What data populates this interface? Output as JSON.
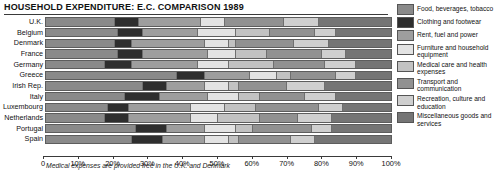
{
  "title": "HOUSEHOLD EXPENDITURE: E.C. COMPARISON  1989",
  "footnote": "Medical expenses are provided free in the U.K. and Denmark",
  "axis": {
    "ticks": [
      "0",
      "10%",
      "20%",
      "30%",
      "40%",
      "50%",
      "60%",
      "70%",
      "80%",
      "90%",
      "100%"
    ],
    "tick_values": [
      0,
      10,
      20,
      30,
      40,
      50,
      60,
      70,
      80,
      90,
      100
    ]
  },
  "chart_data": {
    "type": "bar",
    "orientation": "horizontal",
    "stacked": true,
    "stack_total": 100,
    "title": "HOUSEHOLD EXPENDITURE: E.C. COMPARISON  1989",
    "xlabel": "",
    "ylabel": "",
    "xlim": [
      0,
      100
    ],
    "grid": false,
    "legend_position": "right",
    "note": "Medical expenses are provided free in the U.K. and Denmark",
    "categories": [
      "U.K.",
      "Belgium",
      "Denmark",
      "France",
      "Germany",
      "Greece",
      "Irish Rep.",
      "Italy",
      "Luxembourg",
      "Netherlands",
      "Portugal",
      "Spain"
    ],
    "series": [
      {
        "name": "Food, beverages, tobacco",
        "color": "#8a8a8a",
        "values": [
          20,
          21,
          20,
          21,
          17,
          38,
          28,
          23,
          18,
          17,
          26,
          25
        ]
      },
      {
        "name": "Clothing and footwear",
        "color": "#2e2e2e",
        "values": [
          7,
          7,
          5,
          7,
          8,
          8,
          7,
          10,
          6,
          7,
          9,
          9
        ]
      },
      {
        "name": "Rent, fuel and power",
        "color": "#9e9e9e",
        "values": [
          18,
          16,
          21,
          19,
          19,
          13,
          11,
          14,
          18,
          18,
          11,
          12
        ]
      },
      {
        "name": "Furniture and household equipment",
        "color": "#e3e3e3",
        "values": [
          7,
          11,
          7,
          8,
          9,
          8,
          7,
          9,
          10,
          8,
          9,
          7
        ]
      },
      {
        "name": "Medical care and health expenses",
        "color": "#c2c2c2",
        "values": [
          0,
          10,
          2,
          9,
          13,
          4,
          3,
          6,
          9,
          12,
          5,
          3
        ]
      },
      {
        "name": "Transport and communication",
        "color": "#919191",
        "values": [
          17,
          13,
          17,
          16,
          15,
          13,
          14,
          13,
          18,
          11,
          17,
          15
        ]
      },
      {
        "name": "Recreation, culture and education",
        "color": "#cfcfcf",
        "values": [
          10,
          6,
          10,
          7,
          9,
          6,
          11,
          9,
          7,
          10,
          6,
          7
        ]
      },
      {
        "name": "Miscellaneous goods and services",
        "color": "#757575",
        "values": [
          21,
          16,
          18,
          13,
          10,
          10,
          19,
          16,
          14,
          17,
          17,
          22
        ]
      }
    ]
  }
}
